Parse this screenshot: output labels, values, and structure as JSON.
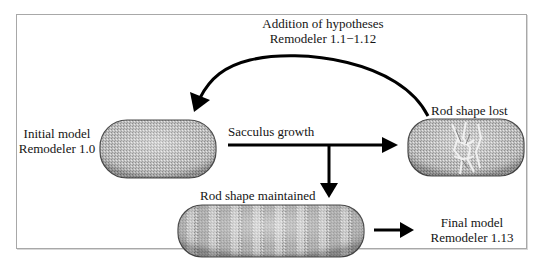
{
  "figure": {
    "top_label": {
      "line1": "Addition of hypotheses",
      "line2": "Remodeler 1.1−1.12"
    },
    "initial": {
      "line1": "Initial model",
      "line2": "Remodeler 1.0"
    },
    "sacculus_growth": "Sacculus growth",
    "rod_shape_lost": "Rod shape lost",
    "rod_shape_maintained": "Rod shape maintained",
    "final": {
      "line1": "Final model",
      "line2": "Remodeler 1.13"
    }
  },
  "colors": {
    "frame_border": "#a8a8a8",
    "arrow": "#000000",
    "cell_fill": "#b8b8b8",
    "cell_edge": "#4a4a4a",
    "text": "#141414"
  },
  "nodes": [
    {
      "id": "initial-model",
      "shape": "rod",
      "state": "intact"
    },
    {
      "id": "rod-shape-lost",
      "shape": "rod",
      "state": "deformed-center"
    },
    {
      "id": "rod-shape-maintained",
      "shape": "elongated-rod",
      "state": "banded"
    }
  ],
  "edges": [
    {
      "from": "initial-model",
      "to": "rod-shape-lost",
      "label": "Sacculus growth"
    },
    {
      "from": "sacculus-growth-branch",
      "to": "rod-shape-maintained",
      "label": ""
    },
    {
      "from": "rod-shape-lost",
      "to": "initial-model",
      "label": "Addition of hypotheses Remodeler 1.1−1.12",
      "style": "curved"
    },
    {
      "from": "rod-shape-maintained",
      "to": "final-model",
      "label": ""
    }
  ]
}
